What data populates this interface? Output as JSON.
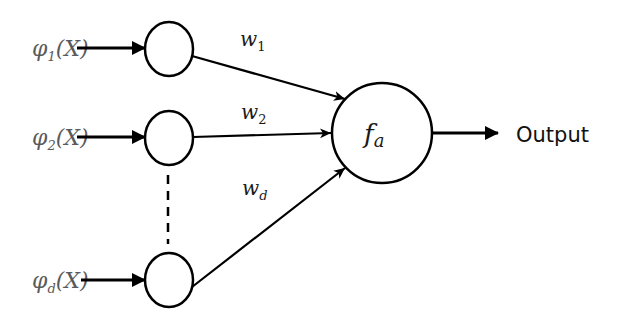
{
  "diagram": {
    "type": "perceptron",
    "inputs": [
      {
        "phi": "φ",
        "sub": "1",
        "arg": "(X)",
        "weight": "w",
        "weight_sub": "1"
      },
      {
        "phi": "φ",
        "sub": "2",
        "arg": "(X)",
        "weight": "w",
        "weight_sub": "2"
      },
      {
        "phi": "φ",
        "sub": "d",
        "arg": "(X)",
        "weight": "w",
        "weight_sub": "d"
      }
    ],
    "activation": {
      "symbol": "f",
      "sub": "a"
    },
    "output_label": "Output",
    "colors": {
      "stroke": "#000000",
      "input_label": "#5a5a5a",
      "background": "#ffffff"
    }
  }
}
